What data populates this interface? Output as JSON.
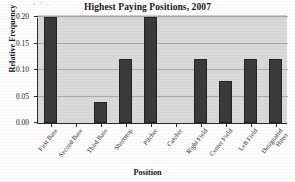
{
  "chart_data": {
    "type": "bar",
    "title": "Highest Paying Positions, 2007",
    "xlabel": "Position",
    "ylabel": "Relative Frequency",
    "categories": [
      "First Base",
      "Second Base",
      "Third Base",
      "Shortstop",
      "Pitcher",
      "Catcher",
      "Right Field",
      "Center Field",
      "Left Field",
      "Designated Hitter"
    ],
    "values": [
      0.2,
      0.0,
      0.04,
      0.12,
      0.2,
      0.0,
      0.12,
      0.08,
      0.12,
      0.12
    ],
    "ylim": [
      0.0,
      0.2
    ],
    "ytick_labels": [
      "0.00",
      "0.05",
      "0.10",
      "0.15",
      "0.20"
    ],
    "ytick_values": [
      0.0,
      0.05,
      0.1,
      0.15,
      0.2
    ],
    "grid": "horizontal",
    "legend": "none",
    "bar_color": "#3a3a3a",
    "plot_background": "#d9d9d9",
    "gridline_color": "#a9a9a9",
    "axis_color": "#2b2b2b"
  }
}
